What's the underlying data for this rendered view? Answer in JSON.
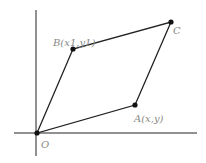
{
  "diagram": {
    "type": "parallelogram",
    "points": {
      "O": {
        "label": "O",
        "x": 37,
        "y": 133
      },
      "A": {
        "label": "A(x,y)",
        "x": 135,
        "y": 105
      },
      "B": {
        "label": "B(x1,y1)",
        "x": 73,
        "y": 49
      },
      "C": {
        "label": "C",
        "x": 171,
        "y": 22
      }
    },
    "colors": {
      "line": "#222222",
      "label": "#888888",
      "point": "#111111"
    }
  }
}
